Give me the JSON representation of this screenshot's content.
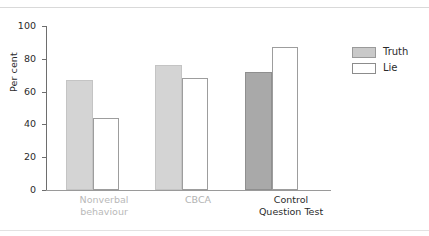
{
  "chart_data": {
    "type": "bar",
    "title": "",
    "xlabel": "",
    "ylabel": "Per cent",
    "ylim": [
      0,
      100
    ],
    "yticks": [
      0,
      20,
      40,
      60,
      80,
      100
    ],
    "ytick_labels": [
      "0",
      "20",
      "40",
      "60",
      "80",
      "100"
    ],
    "grid": false,
    "legend_position": "right",
    "categories": [
      "Nonverbal\nbehaviour",
      "CBCA",
      "Control\nQuestion Test"
    ],
    "series": [
      {
        "name": "Truth",
        "values": [
          67,
          76,
          72
        ],
        "color": "#d4d4d4"
      },
      {
        "name": "Lie",
        "values": [
          44,
          68,
          87
        ],
        "color": "#ffffff"
      }
    ]
  },
  "axis": {
    "y_label": "Per cent",
    "ticks": [
      {
        "value": 100,
        "label": "100"
      },
      {
        "value": 80,
        "label": "80"
      },
      {
        "value": 60,
        "label": "60"
      },
      {
        "value": 40,
        "label": "40"
      },
      {
        "value": 20,
        "label": "20"
      },
      {
        "value": 0,
        "label": "0"
      }
    ]
  },
  "groups": [
    {
      "label_line1": "Nonverbal",
      "label_line2": "behaviour",
      "truth": 67,
      "lie": 44
    },
    {
      "label_line1": "CBCA",
      "label_line2": "",
      "truth": 76,
      "lie": 68
    },
    {
      "label_line1": "Control",
      "label_line2": "Question Test",
      "truth": 72,
      "lie": 87
    }
  ],
  "legend": {
    "items": [
      {
        "label": "Truth",
        "swatch": "filled-grey"
      },
      {
        "label": "Lie",
        "swatch": "outlined-white"
      }
    ]
  },
  "colors": {
    "truth_light": "#d4d4d4",
    "truth_dark": "#a9a9a9",
    "lie_fill": "#ffffff",
    "bar_outline": "#9d9d9d",
    "axis": "#6e6e6e",
    "text": "#2b2b2b",
    "muted_text": "#b9b9b9",
    "rule": "#d9d9d9"
  }
}
